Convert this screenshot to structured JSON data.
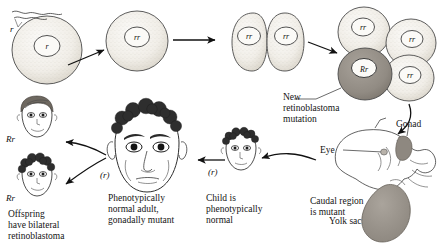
{
  "figure": {
    "colors": {
      "ink": "#141414",
      "cell_fill": "#f4f2ee",
      "cell_stipple": "#b9b3a8",
      "mutant_cell_fill": "#8f8a83",
      "yolk_sac_fill": "#9a948c",
      "gonad_fill": "#8e8880",
      "background": "#ffffff"
    }
  },
  "stages": {
    "zygote": {
      "name": "fertilized-egg",
      "sperm_label": "r",
      "nucleus_label": "r"
    },
    "one_cell": {
      "name": "one-cell-zygote",
      "nucleus_label": "rr"
    },
    "two_cell": {
      "name": "two-cell-embryo",
      "nuclei": [
        "rr",
        "rr"
      ]
    },
    "four_cell": {
      "name": "four-cell-embryo",
      "nuclei": [
        "rr",
        "rr",
        "rr"
      ],
      "mutant_nucleus": "Rr"
    }
  },
  "annotations": {
    "new_mutation": "New\nretinoblastoma\nmutation",
    "gonad": "Gonad",
    "eye": "Eye",
    "caudal": "Caudal region\nis mutant",
    "yolk_sac": "Yolk sac"
  },
  "people": {
    "child": {
      "genotype": "(r)",
      "caption": "Child is\nphenotypically\nnormal"
    },
    "adult": {
      "genotype": "(r)",
      "caption": "Phenotypically\nnormal adult,\ngonadally mutant"
    },
    "offspring_top": {
      "genotype": "Rr"
    },
    "offspring_bottom": {
      "genotype": "Rr"
    },
    "offspring_caption": "Offspring\nhave bilateral\nretinoblastoma"
  }
}
